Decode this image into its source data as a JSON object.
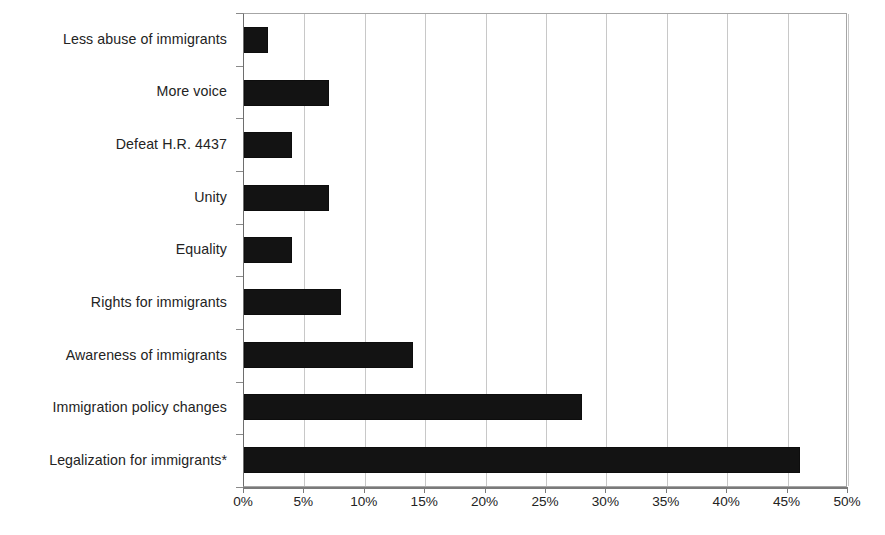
{
  "chart_data": {
    "type": "bar",
    "orientation": "horizontal",
    "title": "",
    "subtitle": "",
    "xlabel": "",
    "ylabel": "",
    "xlim": [
      0,
      50
    ],
    "xtick_step": 5,
    "grid": true,
    "legend": null,
    "bar_color": "#131313",
    "axis_color": "#7a7a7a",
    "gridline_color": "#c8c8c8",
    "value_unit": "%",
    "categories": [
      "Less abuse of immigrants",
      "More voice",
      "Defeat H.R. 4437",
      "Unity",
      "Equality",
      "Rights for immigrants",
      "Awareness of immigrants",
      "Immigration policy changes",
      "Legalization for immigrants*"
    ],
    "values": [
      2,
      7,
      4,
      7,
      4,
      8,
      14,
      28,
      46
    ],
    "xticklabels": [
      "0%",
      "5%",
      "10%",
      "15%",
      "20%",
      "25%",
      "30%",
      "35%",
      "40%",
      "45%",
      "50%"
    ],
    "xtickvalues": [
      0,
      5,
      10,
      15,
      20,
      25,
      30,
      35,
      40,
      45,
      50
    ]
  }
}
